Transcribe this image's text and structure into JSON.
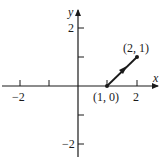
{
  "diagram": {
    "type": "vector-plot",
    "axes": {
      "x_label": "x",
      "y_label": "y",
      "x_tick_labels": [
        "−2",
        "2"
      ],
      "y_tick_labels": [
        "2",
        "−2"
      ],
      "x_range": [
        -2.6,
        2.6
      ],
      "y_range": [
        -2.6,
        2.6
      ],
      "ticks": [
        -2,
        -1,
        1,
        2
      ]
    },
    "vector": {
      "start": [
        1,
        0
      ],
      "end": [
        2,
        1
      ],
      "start_label": "(1, 0)",
      "end_label": "(2, 1)"
    },
    "colors": {
      "ink": "#1a1a1a",
      "background": "#ffffff"
    }
  }
}
